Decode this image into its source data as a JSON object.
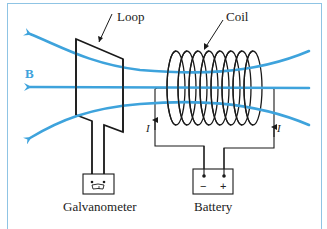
{
  "figure": {
    "labels": {
      "loop": "Loop",
      "coil": "Coil",
      "field": "B",
      "current_left": "I",
      "current_right": "I",
      "galvanometer": "Galvanometer",
      "battery": "Battery",
      "battery_minus": "−",
      "battery_plus": "+"
    },
    "colors": {
      "field_lines": "#3ea3dc",
      "wire": "#1a1a1a",
      "frame": "#8fc4e4"
    }
  }
}
